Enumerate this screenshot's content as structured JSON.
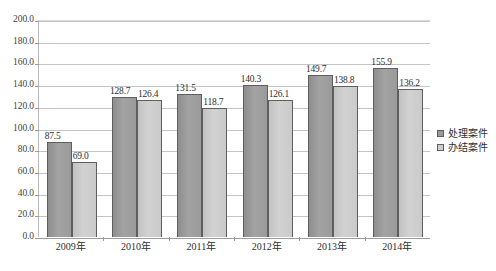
{
  "chart_data": {
    "type": "bar",
    "title": "",
    "xlabel": "",
    "ylabel": "",
    "ylim": [
      0,
      200
    ],
    "ytick_step": 20,
    "grid": true,
    "legend_position": "right",
    "categories": [
      "2009年",
      "2010年",
      "2011年",
      "2012年",
      "2013年",
      "2014年"
    ],
    "ytick_labels": [
      "200.0",
      "180.0",
      "160.0",
      "140.0",
      "120.0",
      "100.0",
      "80.0",
      "60.0",
      "40.0",
      "20.0",
      "0.0"
    ],
    "ytick_values": [
      200,
      180,
      160,
      140,
      120,
      100,
      80,
      60,
      40,
      20,
      0
    ],
    "series": [
      {
        "name": "处理案件",
        "color": "#9a9a9a",
        "values": [
          87.5,
          128.7,
          131.5,
          140.3,
          149.7,
          155.9
        ],
        "labels": [
          "87.5",
          "128.7",
          "131.5",
          "140.3",
          "149.7",
          "155.9"
        ]
      },
      {
        "name": "办结案件",
        "color": "#cecece",
        "values": [
          69.0,
          126.4,
          118.7,
          126.1,
          138.8,
          136.2
        ],
        "labels": [
          "69.0",
          "126.4",
          "118.7",
          "126.1",
          "138.8",
          "136.2"
        ]
      }
    ]
  },
  "legend": {
    "items": [
      {
        "label": "处理案件"
      },
      {
        "label": "办结案件"
      }
    ]
  }
}
